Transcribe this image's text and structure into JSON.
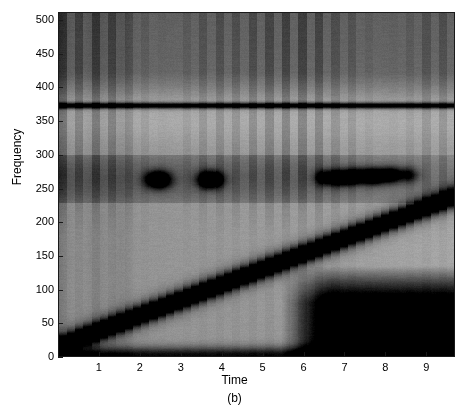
{
  "figure": {
    "caption": "(b)",
    "xlabel": "Time",
    "ylabel": "Frequency"
  },
  "chart_data": {
    "type": "heatmap",
    "title": "",
    "subtitle": "",
    "caption": "(b)",
    "xlabel": "Time",
    "ylabel": "Frequency",
    "colormap": "gray-inverted",
    "grid": false,
    "legend": "none",
    "colorbar": false,
    "xlim": [
      0,
      9.7
    ],
    "ylim": [
      0,
      512
    ],
    "xticks": [
      1,
      2,
      3,
      4,
      5,
      6,
      7,
      8,
      9
    ],
    "xtick_labels": [
      "1",
      "2",
      "3",
      "4",
      "5",
      "6",
      "7",
      "8",
      "9"
    ],
    "yticks": [
      0,
      50,
      100,
      150,
      200,
      250,
      300,
      350,
      400,
      450,
      500
    ],
    "ytick_labels": [
      "0",
      "50",
      "100",
      "150",
      "200",
      "250",
      "300",
      "350",
      "400",
      "450",
      "500"
    ],
    "background_level": 0.42,
    "noise_amplitude": 0.035,
    "components": [
      {
        "name": "linear-chirp",
        "kind": "ridge",
        "description": "Dark diagonal ridge rising linearly from low frequency at t=0 to high frequency at t=9.7, with stair-step quantization from the analysis window.",
        "f_start": 16,
        "f_end": 238,
        "t_start": 0.0,
        "t_end": 9.7,
        "bandwidth": 16,
        "intensity": 0.92,
        "step_count": 34
      },
      {
        "name": "constant-tone",
        "kind": "horizontal-line",
        "description": "Narrow dark horizontal line, a steady sinusoid.",
        "frequency": 373,
        "t_start": 0.0,
        "t_end": 9.7,
        "bandwidth": 5,
        "intensity": 0.78
      },
      {
        "name": "transient-atoms",
        "kind": "blobs",
        "description": "Short isolated dark time-frequency atoms near 263 Hz.",
        "frequency": 263,
        "blobs": [
          {
            "t": 2.45,
            "f": 263,
            "intensity": 0.95,
            "dt": 0.3,
            "df": 14
          },
          {
            "t": 3.72,
            "f": 263,
            "intensity": 0.95,
            "dt": 0.3,
            "df": 14
          },
          {
            "t": 6.55,
            "f": 266,
            "intensity": 0.62,
            "dt": 0.26,
            "df": 13
          },
          {
            "t": 6.95,
            "f": 266,
            "intensity": 0.8,
            "dt": 0.26,
            "df": 13
          },
          {
            "t": 7.32,
            "f": 268,
            "intensity": 0.72,
            "dt": 0.26,
            "df": 13
          },
          {
            "t": 7.72,
            "f": 268,
            "intensity": 0.88,
            "dt": 0.26,
            "df": 13
          },
          {
            "t": 8.12,
            "f": 270,
            "intensity": 0.7,
            "dt": 0.26,
            "df": 13
          },
          {
            "t": 8.55,
            "f": 270,
            "intensity": 0.45,
            "dt": 0.26,
            "df": 13
          }
        ]
      },
      {
        "name": "low-frequency-band",
        "kind": "band",
        "description": "Broad darker band covering roughly 230-300 Hz across early-to-mid times.",
        "f_low": 228,
        "f_high": 300,
        "intensity": 0.22
      },
      {
        "name": "upper-band",
        "kind": "band",
        "description": "Darker region above the constant tone, roughly 380-512 Hz.",
        "f_low": 382,
        "f_high": 512,
        "intensity": 0.26
      },
      {
        "name": "vertical-striations",
        "kind": "vertical-stripes",
        "description": "Regular vertical darker stripes (impulsive events) visible mainly in the upper half.",
        "period": 0.42,
        "intensity": 0.14,
        "count": 23
      },
      {
        "name": "bottom-right-dark-region",
        "kind": "corner-shadow",
        "description": "Strongly dark low-frequency region in the lower right corner, below roughly 110 Hz after t=6.4.",
        "t_start": 6.4,
        "f_high": 110,
        "intensity": 0.85
      },
      {
        "name": "bottom-edge-dark-band",
        "kind": "edge-band",
        "description": "Dark band hugging the very bottom edge across the full time span.",
        "f_high": 10,
        "intensity": 0.55
      }
    ]
  },
  "axes": {
    "y_ticks": [
      {
        "value": 500,
        "label": "500"
      },
      {
        "value": 450,
        "label": "450"
      },
      {
        "value": 400,
        "label": "400"
      },
      {
        "value": 350,
        "label": "350"
      },
      {
        "value": 300,
        "label": "300"
      },
      {
        "value": 250,
        "label": "250"
      },
      {
        "value": 200,
        "label": "200"
      },
      {
        "value": 150,
        "label": "150"
      },
      {
        "value": 100,
        "label": "100"
      },
      {
        "value": 50,
        "label": "50"
      },
      {
        "value": 0,
        "label": "0"
      }
    ],
    "x_ticks": [
      {
        "value": 1,
        "label": "1"
      },
      {
        "value": 2,
        "label": "2"
      },
      {
        "value": 3,
        "label": "3"
      },
      {
        "value": 4,
        "label": "4"
      },
      {
        "value": 5,
        "label": "5"
      },
      {
        "value": 6,
        "label": "6"
      },
      {
        "value": 7,
        "label": "7"
      },
      {
        "value": 8,
        "label": "8"
      },
      {
        "value": 9,
        "label": "9"
      }
    ]
  }
}
